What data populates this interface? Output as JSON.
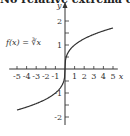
{
  "title": "No relative extrema exist",
  "function_label": "f(x) = ∛x",
  "chart_data": {
    "type": "line",
    "title": "No relative extrema exist",
    "function": "f(x) = cube_root(x)",
    "xlabel": "x",
    "ylabel": "y",
    "xlim": [
      -5.5,
      5.5
    ],
    "ylim": [
      -2.5,
      2.5
    ],
    "x_ticks": [
      -5,
      -4,
      -3,
      -2,
      -1,
      1,
      2,
      3,
      4,
      5
    ],
    "y_ticks": [
      -2,
      -1,
      1,
      2
    ],
    "grid": false,
    "series": [
      {
        "name": "f(x) = ∛x",
        "x": [
          -5,
          -4,
          -3,
          -2,
          -1,
          -0.5,
          -0.1,
          0,
          0.1,
          0.5,
          1,
          2,
          3,
          4,
          5
        ],
        "y": [
          -1.71,
          -1.59,
          -1.44,
          -1.26,
          -1.0,
          -0.79,
          -0.46,
          0,
          0.46,
          0.79,
          1.0,
          1.26,
          1.44,
          1.59,
          1.71
        ]
      }
    ]
  }
}
